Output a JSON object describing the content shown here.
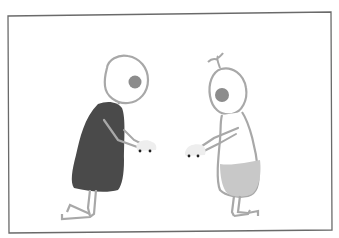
{
  "illustration": {
    "description": "Two hand-drawn stick figures kneeling and facing each other, each holding a small toy car",
    "colors": {
      "background": "#ffffff",
      "frame": "#6a6a6a",
      "line": "#a8a8a8",
      "eye": "#8c8c8c",
      "left_dress": "#4a4a4a",
      "right_diaper": "#c8c8c8",
      "toy_car": "#eeeeee",
      "wheel": "#222222"
    },
    "figures": [
      {
        "name": "left-figure",
        "garment": "dark dress",
        "pose": "kneeling, arms forward"
      },
      {
        "name": "right-figure",
        "garment": "light diaper",
        "pose": "kneeling, arms forward",
        "feature": "sprout on head"
      }
    ],
    "toys": [
      {
        "name": "left-toy-car"
      },
      {
        "name": "right-toy-car"
      }
    ]
  }
}
